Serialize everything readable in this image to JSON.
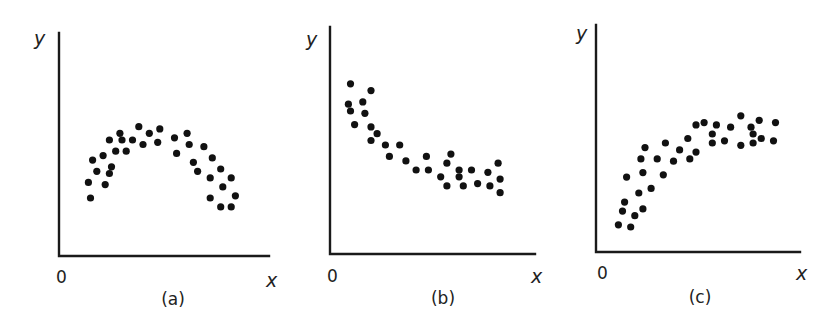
{
  "figure": {
    "panels": [
      "(a)",
      "(b)",
      "(c)"
    ]
  },
  "chart_data": [
    {
      "type": "scatter",
      "title": "",
      "caption": "(a)",
      "xlabel": "x",
      "ylabel": "y",
      "origin_label": "0",
      "xlim": [
        0,
        10
      ],
      "ylim": [
        0,
        10
      ],
      "grid": false,
      "ticks": false,
      "pattern": "inverted-U (quadratic, peak mid-range)",
      "x": [
        3.8,
        4.8,
        4.3,
        2.9,
        2.4,
        3.0,
        3.5,
        4.0,
        4.7,
        2.1,
        2.7,
        3.2,
        1.6,
        2.5,
        1.8,
        2.4,
        1.4,
        2.2,
        1.5,
        5.5,
        6.1,
        6.2,
        6.9,
        5.6,
        7.3,
        6.4,
        7.7,
        6.6,
        7.2,
        8.2,
        7.8,
        8.4,
        7.2,
        7.7,
        8.2
      ],
      "y": [
        5.8,
        5.7,
        5.5,
        5.5,
        5.2,
        5.2,
        5.2,
        5.0,
        5.1,
        4.5,
        4.7,
        4.7,
        4.3,
        4.0,
        3.8,
        3.7,
        3.3,
        3.2,
        2.6,
        5.3,
        5.5,
        5.0,
        4.9,
        4.6,
        4.4,
        4.2,
        3.9,
        3.8,
        3.5,
        3.5,
        3.1,
        2.7,
        2.6,
        2.2,
        2.2
      ]
    },
    {
      "type": "scatter",
      "title": "",
      "caption": "(b)",
      "xlabel": "x",
      "ylabel": "y",
      "origin_label": "0",
      "xlim": [
        0,
        10
      ],
      "ylim": [
        0,
        10
      ],
      "grid": false,
      "ticks": false,
      "pattern": "decreasing, leveling off (exponential decay)",
      "x": [
        1.0,
        2.0,
        0.9,
        1.6,
        1.0,
        1.7,
        1.2,
        2.0,
        2.3,
        2.0,
        2.7,
        3.4,
        2.9,
        3.7,
        4.2,
        4.7,
        5.9,
        4.8,
        5.7,
        5.4,
        5.7,
        6.3,
        6.3,
        6.9,
        6.5,
        7.2,
        7.7,
        7.8,
        8.2,
        8.3,
        8.3
      ],
      "y": [
        7.5,
        7.2,
        6.6,
        6.7,
        6.3,
        6.2,
        5.7,
        5.6,
        5.3,
        5.0,
        4.8,
        4.8,
        4.3,
        4.1,
        3.7,
        4.3,
        4.4,
        3.7,
        4.0,
        3.4,
        3.0,
        3.7,
        3.4,
        3.7,
        3.0,
        3.1,
        3.6,
        3.0,
        4.0,
        3.3,
        2.7
      ]
    },
    {
      "type": "scatter",
      "title": "",
      "caption": "(c)",
      "xlabel": "x",
      "ylabel": "y",
      "origin_label": "0",
      "xlim": [
        0,
        10
      ],
      "ylim": [
        0,
        10
      ],
      "grid": false,
      "ticks": false,
      "pattern": "increasing, leveling off (logarithmic / saturating growth)",
      "x": [
        2.4,
        3.4,
        2.2,
        3.0,
        3.8,
        4.1,
        4.6,
        4.9,
        2.3,
        1.5,
        3.3,
        2.7,
        2.1,
        1.4,
        2.3,
        1.3,
        1.9,
        1.1,
        1.7,
        4.9,
        5.3,
        5.9,
        6.6,
        5.7,
        7.1,
        8.0,
        7.6,
        7.7,
        8.8,
        4.5,
        5.7,
        6.3,
        7.1,
        7.7,
        8.1,
        8.7
      ],
      "y": [
        4.6,
        4.8,
        4.1,
        4.1,
        4.0,
        4.5,
        4.1,
        4.4,
        3.5,
        3.3,
        3.4,
        2.8,
        2.6,
        2.2,
        1.9,
        1.8,
        1.6,
        1.2,
        1.1,
        5.6,
        5.7,
        5.6,
        5.5,
        5.2,
        6.0,
        5.8,
        5.5,
        5.2,
        5.7,
        5.0,
        4.8,
        4.9,
        4.7,
        4.8,
        5.0,
        4.9
      ]
    }
  ],
  "layout": {
    "panels_px": [
      {
        "origin": [
          59,
          256
        ],
        "x_end": 269,
        "y_top": 33,
        "ylabel_pos": [
          34,
          45
        ],
        "origin_pos": [
          56,
          283
        ],
        "xlabel_pos": [
          266,
          287
        ],
        "caption_pos": [
          173,
          305
        ]
      },
      {
        "origin": [
          330,
          254
        ],
        "x_end": 535,
        "y_top": 27,
        "ylabel_pos": [
          306,
          46
        ],
        "origin_pos": [
          327,
          282
        ],
        "xlabel_pos": [
          531,
          283
        ],
        "caption_pos": [
          443,
          304
        ]
      },
      {
        "origin": [
          596,
          252
        ],
        "x_end": 800,
        "y_top": 25,
        "ylabel_pos": [
          576,
          40
        ],
        "origin_pos": [
          597,
          279
        ],
        "xlabel_pos": [
          796,
          280
        ],
        "caption_pos": [
          700,
          303
        ]
      }
    ],
    "dot_radius": 3.6,
    "axis_color": "#1a1a1a",
    "dot_color": "#111111"
  }
}
